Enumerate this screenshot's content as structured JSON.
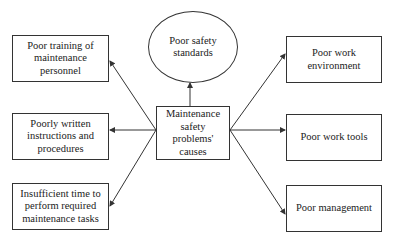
{
  "diagram": {
    "center": {
      "label": "Maintenance\nsafety\nproblems'\ncauses"
    },
    "top": {
      "label": "Poor safety\nstandards"
    },
    "left": [
      {
        "label": "Poor training of\nmaintenance\npersonnel"
      },
      {
        "label": "Poorly written\ninstructions and\nprocedures"
      },
      {
        "label": "Insufficient time to\nperform required\nmaintenance tasks"
      }
    ],
    "right": [
      {
        "label": "Poor work\nenvironment"
      },
      {
        "label": "Poor work tools"
      },
      {
        "label": "Poor management"
      }
    ],
    "colors": {
      "stroke": "#333333",
      "background": "#ffffff",
      "text": "#222222"
    }
  }
}
